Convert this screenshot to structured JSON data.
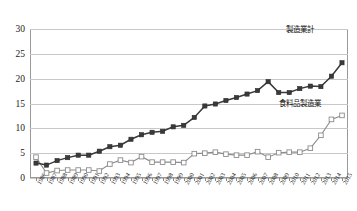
{
  "chart_data": {
    "type": "line",
    "title": "",
    "xlabel": "",
    "ylabel": "",
    "ylim": [
      0,
      30
    ],
    "yticks": [
      0,
      5,
      10,
      15,
      20,
      25,
      30
    ],
    "grid": true,
    "legend_position": "inline-annotation",
    "categories": [
      "1986",
      "1987",
      "1988",
      "1989",
      "1990",
      "1991",
      "1992",
      "1993",
      "1994",
      "1995",
      "1996",
      "1997",
      "1998",
      "1999",
      "2000",
      "2001",
      "2002",
      "2003",
      "2004",
      "2005",
      "2006",
      "2007",
      "2008",
      "2009",
      "2010",
      "2011",
      "2012",
      "2013",
      "2014",
      "2015"
    ],
    "series": [
      {
        "name": "製造業計",
        "marker": "filled-square",
        "color": "#3a3a3a",
        "values": [
          3.0,
          2.6,
          3.5,
          4.1,
          4.6,
          4.6,
          5.4,
          6.3,
          6.6,
          7.8,
          8.7,
          9.2,
          9.4,
          10.3,
          10.6,
          12.2,
          14.5,
          14.9,
          15.6,
          16.2,
          16.9,
          17.6,
          19.4,
          17.2,
          17.2,
          18.0,
          18.5,
          18.4,
          20.5,
          23.2
        ]
      },
      {
        "name": "食料品製造業",
        "marker": "open-square",
        "color": "#8c8c8c",
        "values": [
          4.2,
          1.0,
          1.5,
          1.6,
          1.6,
          1.6,
          1.4,
          2.8,
          3.6,
          3.1,
          4.3,
          3.2,
          3.2,
          3.2,
          3.1,
          4.9,
          5.0,
          5.2,
          4.8,
          4.6,
          4.6,
          5.3,
          4.2,
          5.1,
          5.2,
          5.2,
          6.0,
          8.6,
          11.8,
          12.6
        ]
      }
    ],
    "series_extended": {
      "製造業計_tail": [
        24.7,
        25.8
      ],
      "note": ""
    },
    "annotations": [
      {
        "id": "total",
        "text": "製造業計"
      },
      {
        "id": "food",
        "text": "食料品製造業"
      }
    ]
  },
  "annotations": {
    "total_label": "製造業計",
    "food_label": "食料品製造業"
  }
}
